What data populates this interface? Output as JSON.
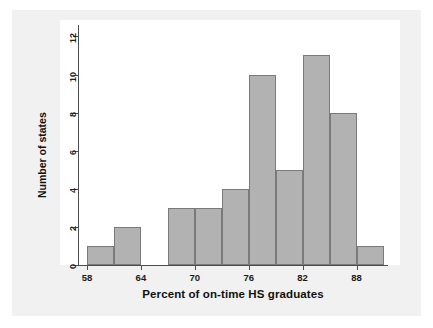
{
  "chart_data": {
    "type": "bar",
    "title": "",
    "subtitle": "",
    "xlabel": "Percent of on-time HS graduates",
    "ylabel": "Number of states",
    "xlim": [
      57.0,
      91.5
    ],
    "ylim": [
      0,
      12.6
    ],
    "grid": false,
    "legend": null,
    "x_ticks": [
      58,
      64,
      70,
      76,
      82,
      88
    ],
    "x_tick_labels": [
      "58",
      "64",
      "70",
      "76",
      "82",
      "88"
    ],
    "y_ticks": [
      0,
      2,
      4,
      6,
      8,
      10,
      12
    ],
    "y_tick_labels": [
      "0",
      "2",
      "4",
      "6",
      "8",
      "10",
      "12"
    ],
    "bin_width": 3,
    "bins": [
      {
        "start": 58,
        "end": 61,
        "count": 1
      },
      {
        "start": 61,
        "end": 64,
        "count": 2
      },
      {
        "start": 64,
        "end": 67,
        "count": 0
      },
      {
        "start": 67,
        "end": 70,
        "count": 3
      },
      {
        "start": 70,
        "end": 73,
        "count": 3
      },
      {
        "start": 73,
        "end": 76,
        "count": 4
      },
      {
        "start": 76,
        "end": 79,
        "count": 10
      },
      {
        "start": 79,
        "end": 82,
        "count": 5
      },
      {
        "start": 82,
        "end": 85,
        "count": 11
      },
      {
        "start": 85,
        "end": 88,
        "count": 8
      },
      {
        "start": 88,
        "end": 91,
        "count": 1
      }
    ],
    "categories": [
      "58-61",
      "61-64",
      "64-67",
      "67-70",
      "70-73",
      "73-76",
      "76-79",
      "79-82",
      "82-85",
      "85-88",
      "88-91"
    ],
    "values": [
      1,
      2,
      0,
      3,
      3,
      4,
      10,
      5,
      11,
      8,
      1
    ],
    "colors": {
      "bar_fill": "#b2b2b2",
      "bar_edge": "#7a7a7a",
      "axis": "#4d4d4d",
      "text": "#111111",
      "plot_background": "#ffffff",
      "panel_background": "#f1f1f1",
      "page_background": "#ffffff"
    }
  }
}
